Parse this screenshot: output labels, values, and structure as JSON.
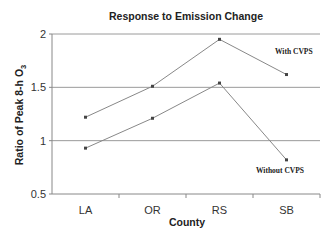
{
  "chart_data": {
    "type": "line",
    "title": "Response to Emission Change",
    "xlabel": "County",
    "ylabel": "Ratio of Peak 8-h O",
    "ylabel_subscript": "3",
    "categories": [
      "LA",
      "OR",
      "RS",
      "SB"
    ],
    "series": [
      {
        "name": "With CVPS",
        "values": [
          1.22,
          1.51,
          1.95,
          1.62
        ]
      },
      {
        "name": "Without CVPS",
        "values": [
          0.93,
          1.21,
          1.54,
          0.82
        ]
      }
    ],
    "ylim": [
      0.5,
      2
    ],
    "yticks": [
      0.5,
      1,
      1.5,
      2
    ],
    "ytick_labels": [
      "0.5",
      "1",
      "1.5",
      "2"
    ],
    "grid": "horizontal",
    "legend": "inline annotations",
    "annotations": [
      {
        "text": "With CVPS",
        "near": "SB upper series"
      },
      {
        "text": "Without CVPS",
        "near": "SB lower series"
      }
    ],
    "line_color": "#888888",
    "marker_color": "#444444"
  }
}
